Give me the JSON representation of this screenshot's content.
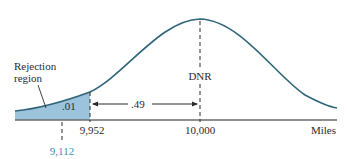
{
  "figure": {
    "type": "normal-distribution-diagram",
    "axis_label": "Miles",
    "center_value": "10,000",
    "center_label": "DNR",
    "critical_value": "9,952",
    "sample_value": "9,112",
    "tail_probability": ".01",
    "middle_probability": ".49",
    "region_label_line1": "Rejection",
    "region_label_line2": "region",
    "colors": {
      "curve": "#2f6479",
      "shade": "#9cc3dc",
      "axis": "#555555",
      "text": "#2b2b2b",
      "highlight_value": "#3d8fc0"
    }
  }
}
